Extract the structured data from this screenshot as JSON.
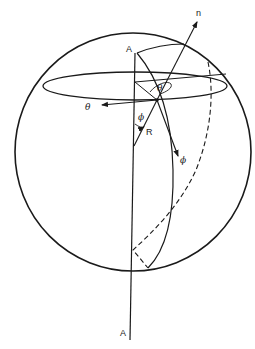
{
  "diagram": {
    "type": "spherical-coordinate-geometry",
    "labels": {
      "axis_top": "A",
      "axis_bottom": "A",
      "normal": "n",
      "theta_arrow": "θ",
      "theta_angle": "θ",
      "phi_angle": "ϕ",
      "phi_arrow": "ϕ",
      "radius": "R"
    },
    "elements": [
      "sphere outline",
      "equatorial ellipse",
      "rotation axis A–A",
      "meridian (solid)",
      "meridian (dashed, hidden)",
      "normal vector n",
      "unit vector θ",
      "unit vector ϕ",
      "radius R",
      "angle θ",
      "angle ϕ"
    ],
    "colors": {
      "stroke": "#1a1a1a",
      "background": "#ffffff"
    }
  }
}
